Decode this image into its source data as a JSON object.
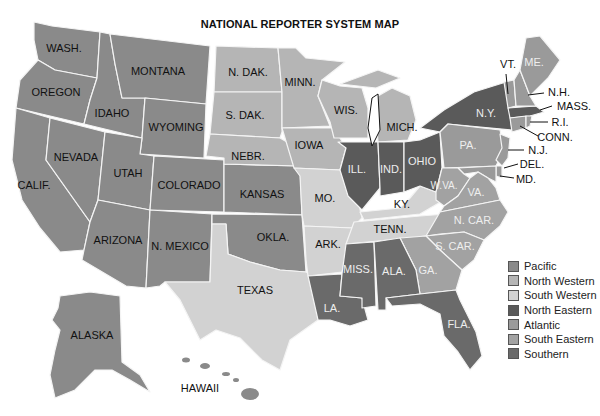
{
  "title": "NATIONAL REPORTER SYSTEM MAP",
  "colors": {
    "Pacific": "#8a8a8a",
    "North Western": "#b5b5b5",
    "South Western": "#d2d2d2",
    "North Eastern": "#5a5a5a",
    "Atlantic": "#9a9a9a",
    "South Eastern": "#a2a2a2",
    "Southern": "#6a6a6a"
  },
  "legend": [
    {
      "label": "Pacific",
      "color": "#8a8a8a"
    },
    {
      "label": "North Western",
      "color": "#b5b5b5"
    },
    {
      "label": "South Western",
      "color": "#d2d2d2"
    },
    {
      "label": "North Eastern",
      "color": "#5a5a5a"
    },
    {
      "label": "Atlantic",
      "color": "#9a9a9a"
    },
    {
      "label": "South Eastern",
      "color": "#a2a2a2"
    },
    {
      "label": "Southern",
      "color": "#6a6a6a"
    }
  ],
  "states": {
    "wash": {
      "label": "WASH.",
      "region": "Pacific"
    },
    "oregon": {
      "label": "OREGON",
      "region": "Pacific"
    },
    "calif": {
      "label": "CALIF.",
      "region": "Pacific"
    },
    "nevada": {
      "label": "NEVADA",
      "region": "Pacific"
    },
    "idaho": {
      "label": "IDAHO",
      "region": "Pacific"
    },
    "montana": {
      "label": "MONTANA",
      "region": "Pacific"
    },
    "wyoming": {
      "label": "WYOMING",
      "region": "Pacific"
    },
    "utah": {
      "label": "UTAH",
      "region": "Pacific"
    },
    "colorado": {
      "label": "COLORADO",
      "region": "Pacific"
    },
    "arizona": {
      "label": "ARIZONA",
      "region": "Pacific"
    },
    "nmexico": {
      "label": "N. MEXICO",
      "region": "Pacific"
    },
    "kansas": {
      "label": "KANSAS",
      "region": "Pacific"
    },
    "okla": {
      "label": "OKLA.",
      "region": "Pacific"
    },
    "alaska": {
      "label": "ALASKA",
      "region": "Pacific"
    },
    "hawaii": {
      "label": "HAWAII",
      "region": "Pacific"
    },
    "ndak": {
      "label": "N. DAK.",
      "region": "North Western"
    },
    "sdak": {
      "label": "S. DAK.",
      "region": "North Western"
    },
    "nebr": {
      "label": "NEBR.",
      "region": "North Western"
    },
    "minn": {
      "label": "MINN.",
      "region": "North Western"
    },
    "iowa": {
      "label": "IOWA",
      "region": "North Western"
    },
    "wis": {
      "label": "WIS.",
      "region": "North Western"
    },
    "mich": {
      "label": "MICH.",
      "region": "North Western"
    },
    "texas": {
      "label": "TEXAS",
      "region": "South Western"
    },
    "mo": {
      "label": "MO.",
      "region": "South Western"
    },
    "ark": {
      "label": "ARK.",
      "region": "South Western"
    },
    "ky": {
      "label": "KY.",
      "region": "South Western"
    },
    "tenn": {
      "label": "TENN.",
      "region": "South Western"
    },
    "la": {
      "label": "LA.",
      "region": "Southern"
    },
    "miss": {
      "label": "MISS.",
      "region": "Southern"
    },
    "ala": {
      "label": "ALA.",
      "region": "Southern"
    },
    "fla": {
      "label": "FLA.",
      "region": "Southern"
    },
    "ill": {
      "label": "ILL.",
      "region": "North Eastern"
    },
    "ind": {
      "label": "IND.",
      "region": "North Eastern"
    },
    "ohio": {
      "label": "OHIO",
      "region": "North Eastern"
    },
    "ny": {
      "label": "N.Y.",
      "region": "North Eastern"
    },
    "mass": {
      "label": "MASS.",
      "region": "North Eastern"
    },
    "pa": {
      "label": "PA.",
      "region": "Atlantic"
    },
    "nj": {
      "label": "N.J.",
      "region": "Atlantic"
    },
    "del": {
      "label": "DEL.",
      "region": "Atlantic"
    },
    "md": {
      "label": "MD.",
      "region": "Atlantic"
    },
    "me": {
      "label": "ME.",
      "region": "Atlantic"
    },
    "vt": {
      "label": "VT.",
      "region": "Atlantic"
    },
    "nh": {
      "label": "N.H.",
      "region": "Atlantic"
    },
    "ri": {
      "label": "R.I.",
      "region": "Atlantic"
    },
    "conn": {
      "label": "CONN.",
      "region": "Atlantic"
    },
    "wva": {
      "label": "W.VA.",
      "region": "South Eastern"
    },
    "va": {
      "label": "VA.",
      "region": "South Eastern"
    },
    "ncar": {
      "label": "N. CAR.",
      "region": "South Eastern"
    },
    "scar": {
      "label": "S. CAR.",
      "region": "South Eastern"
    },
    "ga": {
      "label": "GA.",
      "region": "South Eastern"
    }
  }
}
